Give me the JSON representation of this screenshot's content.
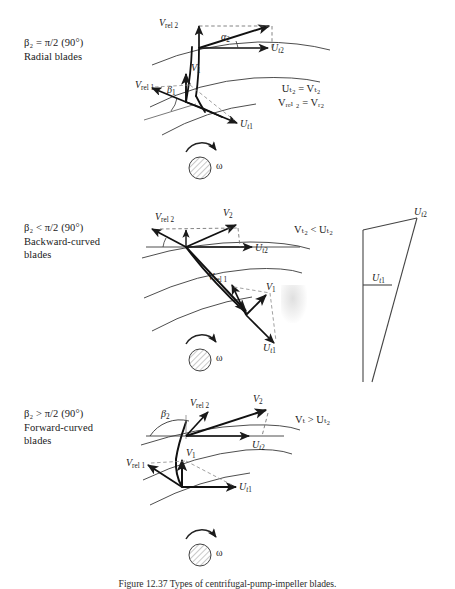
{
  "figure": {
    "caption": "Figure 12.37   Types of centrifugal-pump-impeller blades.",
    "page_background": "#ffffff",
    "ink_color": "#1a1a1a"
  },
  "panels": [
    {
      "id": "radial",
      "description": {
        "line1": "β₂ = π/2 (90°)",
        "line2": "Radial blades",
        "line3": ""
      },
      "relations": {
        "line1": "Uₜ₂ = Vₜ₂",
        "line2": "Vᵣₑₗ ₂ = Vᵣ₂"
      },
      "vector_labels": {
        "v_rel_2": "V rel 2",
        "v_rel_1": "V rel 1",
        "v_1": "V 1",
        "u_t2": "U t2",
        "u_t1": "U t1",
        "alpha_2": "α₂",
        "beta_1": "β₁"
      },
      "rotation_symbol": "ω"
    },
    {
      "id": "backward-curved",
      "description": {
        "line1": "β₂ < π/2 (90°)",
        "line2": "Backward-curved",
        "line3": "blades"
      },
      "relations": {
        "line1": "Vₜ₂ < Uₜ₂",
        "line2": ""
      },
      "vector_labels": {
        "v_rel_2": "V rel 2",
        "v_rel_1": "V rel 1",
        "v_1": "V 1",
        "v_2": "V 2",
        "u_t2": "U t2",
        "u_t1": "U t1"
      },
      "rotation_symbol": "ω"
    },
    {
      "id": "forward-curved",
      "description": {
        "line1": "β₂ > π/2 (90°)",
        "line2": "Forward-curved",
        "line3": "blades"
      },
      "relations": {
        "line1": "Vₜ > Uₜ₂",
        "line2": ""
      },
      "vector_labels": {
        "v_rel_2": "V rel 2",
        "v_rel_1": "V rel 1",
        "v_1": "V 1",
        "v_2": "V 2",
        "u_t2": "U t2",
        "u_t1": "U t1",
        "beta_2": "β₂"
      },
      "rotation_symbol": "ω"
    }
  ],
  "side_triangle": {
    "label_top": "U t2",
    "label_mid": "U t1"
  },
  "text_parts": {
    "V": "V",
    "U": "U",
    "rel": "rel",
    "t": "t",
    "r": "r",
    "one": "1",
    "two": "2",
    "eq": "=",
    "lt": "<",
    "gt": ">",
    "omega": "ω",
    "alpha": "α",
    "beta": "β",
    "pi_expr": "π/2 (90°)"
  }
}
